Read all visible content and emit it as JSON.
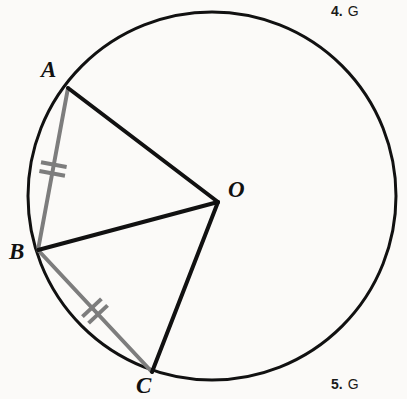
{
  "figure": {
    "name": "circle-with-two-congruent-chords",
    "background_color": "#fbfaf8",
    "width": 407,
    "height": 399,
    "circle": {
      "label": "circle-O",
      "center_x": 212,
      "center_y": 196,
      "radius": 184,
      "stroke_color": "#111111",
      "stroke_width": 3
    },
    "points": {
      "O": {
        "label": "O",
        "x": 218,
        "y": 202,
        "role": "center"
      },
      "A": {
        "label": "A",
        "x": 68,
        "y": 88,
        "role": "on-circle"
      },
      "B": {
        "label": "B",
        "x": 38,
        "y": 250,
        "role": "on-circle"
      },
      "C": {
        "label": "C",
        "x": 152,
        "y": 372,
        "role": "on-circle"
      }
    },
    "radii": [
      {
        "name": "segment-AO",
        "from": "A",
        "to": "O",
        "x1": 68,
        "y1": 88,
        "x2": 218,
        "y2": 202,
        "color": "#111111",
        "width": 4
      },
      {
        "name": "segment-BO",
        "from": "B",
        "to": "O",
        "x1": 38,
        "y1": 250,
        "x2": 218,
        "y2": 202,
        "color": "#111111",
        "width": 4
      },
      {
        "name": "segment-CO",
        "from": "C",
        "to": "O",
        "x1": 152,
        "y1": 372,
        "x2": 218,
        "y2": 202,
        "color": "#111111",
        "width": 4
      }
    ],
    "chords": [
      {
        "name": "chord-AB",
        "from": "A",
        "to": "B",
        "x1": 68,
        "y1": 88,
        "x2": 38,
        "y2": 250,
        "color": "#7d7d7d",
        "width": 4,
        "tick_marks": 2,
        "tick_label": "double-tick-mark"
      },
      {
        "name": "chord-BC",
        "from": "B",
        "to": "C",
        "x1": 38,
        "y1": 250,
        "x2": 152,
        "y2": 372,
        "color": "#7d7d7d",
        "width": 4,
        "tick_marks": 2,
        "tick_label": "double-tick-mark"
      }
    ],
    "tick_color": "#7d7d7d",
    "tick_width": 4,
    "tick_length": 26,
    "tick_gap": 9
  },
  "labels": {
    "A": "A",
    "B": "B",
    "C": "C",
    "O": "O"
  },
  "exercises": [
    {
      "number": "4.",
      "fragment": "G"
    },
    {
      "number": "5.",
      "fragment": "G"
    }
  ]
}
